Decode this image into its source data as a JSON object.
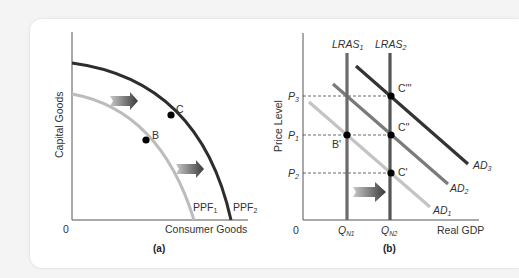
{
  "figure": {
    "panel_a": {
      "caption": "(a)",
      "xlabel": "Consumer Goods",
      "ylabel": "Capital Goods",
      "origin": "0",
      "curves": [
        {
          "name": "PPF",
          "sub": "1",
          "color": "#b9b9b9"
        },
        {
          "name": "PPF",
          "sub": "2",
          "color": "#2d2d2d"
        }
      ],
      "points": [
        {
          "label": "B",
          "on": "PPF1"
        },
        {
          "label": "C",
          "on": "PPF2"
        }
      ]
    },
    "panel_b": {
      "caption": "(b)",
      "xlabel": "Real GDP",
      "ylabel": "Price Level",
      "origin": "0",
      "x_ticks": [
        {
          "main": "Q",
          "sub": "N1"
        },
        {
          "main": "Q",
          "sub": "N2"
        }
      ],
      "y_ticks": [
        {
          "main": "P",
          "sub": "3"
        },
        {
          "main": "P",
          "sub": "1"
        },
        {
          "main": "P",
          "sub": "2"
        }
      ],
      "lras": [
        {
          "main": "LRAS",
          "sub": "1"
        },
        {
          "main": "LRAS",
          "sub": "2"
        }
      ],
      "ad": [
        {
          "main": "AD",
          "sub": "1",
          "color": "#c4c4c4"
        },
        {
          "main": "AD",
          "sub": "2",
          "color": "#7a7a7a"
        },
        {
          "main": "AD",
          "sub": "3",
          "color": "#333333"
        }
      ],
      "points": [
        {
          "label": "B'"
        },
        {
          "label": "C'"
        },
        {
          "label": "C''"
        },
        {
          "label": "C'''"
        }
      ]
    }
  }
}
